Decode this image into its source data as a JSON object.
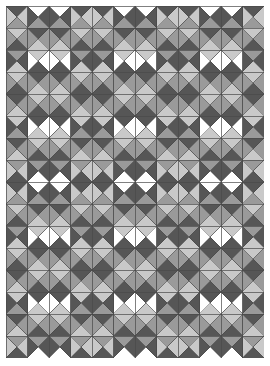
{
  "figure": {
    "width": 270,
    "height": 366,
    "margin": {
      "left": 6,
      "top": 6,
      "right": 6,
      "bottom": 8
    },
    "background": "#ffffff"
  },
  "grid": {
    "columns": 12,
    "rows": 16,
    "cell_width": 21.5,
    "cell_height": 22.0,
    "stroke_color": "#4a4a4a",
    "stroke_width": 0.45
  },
  "palette": {
    "white": "#ffffff",
    "light": "#c9c9c9",
    "mid": "#9a9a9a",
    "dark": "#565656",
    "outline": "#4a4a4a"
  },
  "legend": {
    "tones": [
      {
        "name": "white",
        "label": "White",
        "hex": "#ffffff"
      },
      {
        "name": "light",
        "label": "Light gray",
        "hex": "#c9c9c9"
      },
      {
        "name": "mid",
        "label": "Mid gray",
        "hex": "#9a9a9a"
      },
      {
        "name": "dark",
        "label": "Dark gray",
        "hex": "#565656"
      }
    ]
  },
  "pattern": {
    "type": "quarter-square-triangle",
    "block_size": 4,
    "description": "Each grid cell is divided by both diagonals into four triangles (top, right, bottom, left). Tones repeat on a 4x4 block with mirror symmetry.",
    "triangle_order": [
      "top",
      "right",
      "bottom",
      "left"
    ],
    "blocks": [
      [
        [
          "dark",
          "light",
          "mid",
          "light"
        ],
        [
          "white",
          "dark",
          "mid",
          "dark"
        ],
        [
          "white",
          "dark",
          "mid",
          "dark"
        ],
        [
          "dark",
          "light",
          "mid",
          "light"
        ]
      ],
      [
        [
          "light",
          "mid",
          "dark",
          "mid"
        ],
        [
          "dark",
          "mid",
          "light",
          "mid"
        ],
        [
          "dark",
          "mid",
          "light",
          "mid"
        ],
        [
          "light",
          "mid",
          "dark",
          "mid"
        ]
      ],
      [
        [
          "mid",
          "dark",
          "light",
          "dark"
        ],
        [
          "light",
          "white",
          "dark",
          "white"
        ],
        [
          "light",
          "white",
          "dark",
          "white"
        ],
        [
          "mid",
          "dark",
          "light",
          "dark"
        ]
      ],
      [
        [
          "light",
          "mid",
          "dark",
          "mid"
        ],
        [
          "dark",
          "mid",
          "light",
          "mid"
        ],
        [
          "dark",
          "mid",
          "light",
          "mid"
        ],
        [
          "light",
          "mid",
          "dark",
          "mid"
        ]
      ]
    ]
  },
  "chart_data": {
    "type": "heatmap",
    "xlabel": "",
    "ylabel": "",
    "columns": 12,
    "rows": 16,
    "categories": [
      "white",
      "light",
      "mid",
      "dark"
    ],
    "values": [
      4,
      4,
      4,
      4
    ],
    "legend_position": "none",
    "grid": true
  }
}
